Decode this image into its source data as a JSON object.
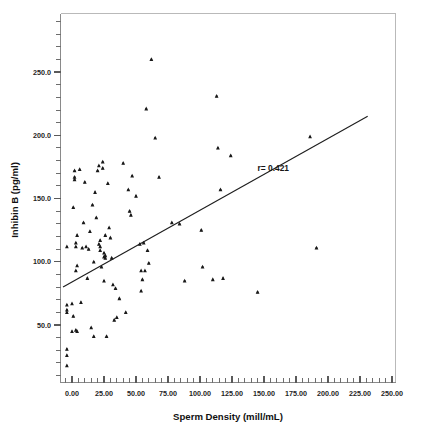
{
  "chart_data": {
    "type": "scatter",
    "title": "",
    "xlabel": "Sperm Density (mill/mL)",
    "ylabel": "Inhibin B (pg/ml)",
    "xlim": [
      -12,
      252
    ],
    "ylim": [
      8,
      290
    ],
    "grid": false,
    "legend": null,
    "xticks": [
      "0.00",
      "25.00",
      "50.00",
      "75.00",
      "100.00",
      "125.00",
      "150.00",
      "175.00",
      "200.00",
      "225.00",
      "250.00"
    ],
    "xtick_values": [
      0,
      25,
      50,
      75,
      100,
      125,
      150,
      175,
      200,
      225,
      250
    ],
    "xminor_per_major": 5,
    "yticks": [
      "50.0",
      "100.0",
      "150.0",
      "200.0",
      "250.0"
    ],
    "ytick_values": [
      50,
      100,
      150,
      200,
      250
    ],
    "yminor_per_major": 5,
    "annotations": [
      {
        "text": "r= 0.421",
        "x": 145,
        "y": 172
      }
    ],
    "correlation_label": "r= 0.421",
    "correlation_value": 0.421,
    "fit_line": {
      "x_start": -7,
      "y_start": 80,
      "x_end": 231,
      "y_end": 215
    },
    "marker": "filled-triangle",
    "marker_color": "#1a1a1a",
    "points": [
      [
        -4,
        112
      ],
      [
        -4,
        66
      ],
      [
        -4,
        62
      ],
      [
        -4,
        60
      ],
      [
        -4,
        31
      ],
      [
        -4,
        26
      ],
      [
        -4,
        18
      ],
      [
        0,
        67
      ],
      [
        0,
        45
      ],
      [
        1,
        143
      ],
      [
        1,
        57
      ],
      [
        2,
        172
      ],
      [
        2,
        167
      ],
      [
        2,
        165
      ],
      [
        3,
        115
      ],
      [
        3,
        112
      ],
      [
        3,
        93
      ],
      [
        3,
        46
      ],
      [
        4,
        121
      ],
      [
        4,
        97
      ],
      [
        4,
        45
      ],
      [
        6,
        173
      ],
      [
        7,
        68
      ],
      [
        8,
        111
      ],
      [
        9,
        131
      ],
      [
        10,
        163
      ],
      [
        11,
        112
      ],
      [
        12,
        87
      ],
      [
        13,
        110
      ],
      [
        14,
        124
      ],
      [
        15,
        48
      ],
      [
        16,
        145
      ],
      [
        17,
        100
      ],
      [
        17,
        41
      ],
      [
        18,
        155
      ],
      [
        19,
        135
      ],
      [
        20,
        172
      ],
      [
        21,
        176
      ],
      [
        21,
        114
      ],
      [
        22,
        117
      ],
      [
        22,
        112
      ],
      [
        22,
        109
      ],
      [
        23,
        96
      ],
      [
        24,
        179
      ],
      [
        24,
        174
      ],
      [
        25,
        107
      ],
      [
        25,
        104
      ],
      [
        25,
        85
      ],
      [
        26,
        121
      ],
      [
        26,
        105
      ],
      [
        26,
        103
      ],
      [
        27,
        41
      ],
      [
        28,
        162
      ],
      [
        29,
        127
      ],
      [
        30,
        119
      ],
      [
        31,
        103
      ],
      [
        32,
        82
      ],
      [
        33,
        54
      ],
      [
        34,
        79
      ],
      [
        35,
        56
      ],
      [
        37,
        71
      ],
      [
        40,
        178
      ],
      [
        42,
        60
      ],
      [
        44,
        157
      ],
      [
        45,
        140
      ],
      [
        46,
        137
      ],
      [
        47,
        168
      ],
      [
        50,
        152
      ],
      [
        53,
        114
      ],
      [
        54,
        93
      ],
      [
        54,
        77
      ],
      [
        55,
        86
      ],
      [
        56,
        115
      ],
      [
        57,
        93
      ],
      [
        58,
        221
      ],
      [
        59,
        109
      ],
      [
        60,
        99
      ],
      [
        62,
        260
      ],
      [
        65,
        198
      ],
      [
        68,
        167
      ],
      [
        78,
        131
      ],
      [
        84,
        130
      ],
      [
        88,
        85
      ],
      [
        101,
        125
      ],
      [
        102,
        96
      ],
      [
        110,
        86
      ],
      [
        113,
        231
      ],
      [
        114,
        190
      ],
      [
        116,
        157
      ],
      [
        118,
        87
      ],
      [
        124,
        184
      ],
      [
        145,
        76
      ],
      [
        186,
        199
      ],
      [
        191,
        111
      ]
    ]
  },
  "axis": {
    "x_title": "Sperm Density (mill/mL)",
    "y_title": "Inhibin B (pg/ml)"
  }
}
